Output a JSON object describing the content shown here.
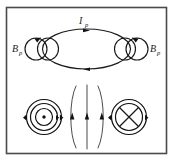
{
  "figure": {
    "background_color": "#ffffff",
    "border_color": "#4a4a4a",
    "line_color": "#1a1a1a",
    "width": 173,
    "height": 161
  },
  "labels": {
    "current_symbol": "I",
    "current_subscript": "p",
    "field_left_symbol": "B",
    "field_left_subscript": "p",
    "field_right_symbol": "B",
    "field_right_subscript": "p"
  },
  "panels": {
    "top": {
      "name": "perspective-loop-view",
      "description": "Large horizontal ellipse representing the plasma current ring with circulating current I_p, flanked by small poloidal field loops B_p on left and right."
    },
    "bottom": {
      "name": "cross-section-view",
      "description": "Cross section showing current out of page (dot) on the left, current into page (cross) on the right, with concentric poloidal field circles and vertical field lines between them."
    }
  },
  "markers": {
    "current_out_of_page": "dot",
    "current_into_page": "cross",
    "arrow_direction_top_loop": "clockwise-right",
    "arrow_direction_center_lines": "upward"
  }
}
